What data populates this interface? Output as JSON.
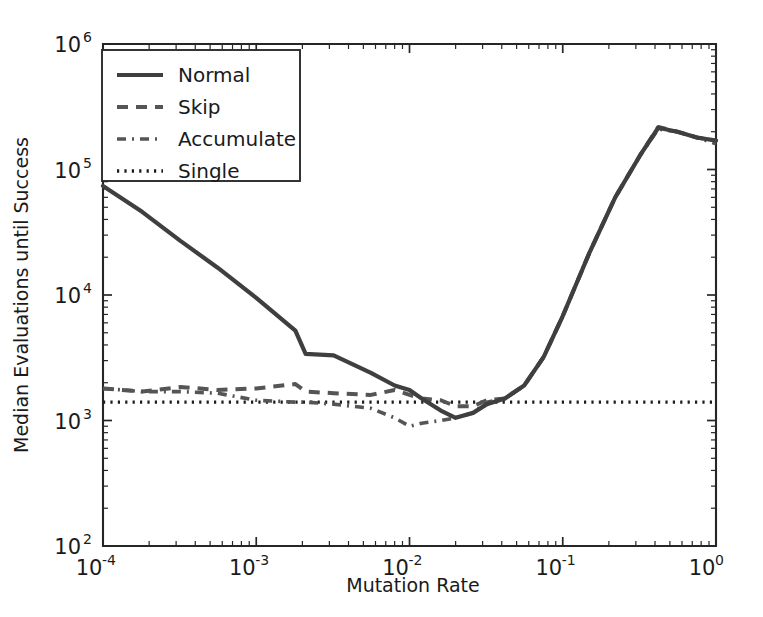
{
  "chart_data": {
    "type": "line",
    "title": "",
    "xlabel": "Mutation Rate",
    "ylabel": "Median Evaluations until Success",
    "xscale": "log",
    "yscale": "log",
    "xlim": [
      0.0001,
      1.0
    ],
    "ylim": [
      100,
      1000000
    ],
    "xticks": [
      0.0001,
      0.001,
      0.01,
      0.1,
      1.0
    ],
    "xticklabels": [
      "10^-4",
      "10^-3",
      "10^-2",
      "10^-1",
      "10^0"
    ],
    "yticks": [
      100,
      1000,
      10000,
      100000,
      1000000
    ],
    "yticklabels": [
      "10^2",
      "10^3",
      "10^4",
      "10^5",
      "10^6"
    ],
    "grid": false,
    "legend_position": "upper left",
    "series": [
      {
        "name": "Normal",
        "linestyle": "solid",
        "color": "#3f3f3f",
        "x": [
          0.0001,
          0.00018,
          0.00032,
          0.00056,
          0.001,
          0.0018,
          0.0021,
          0.0032,
          0.0056,
          0.008,
          0.01,
          0.012,
          0.016,
          0.02,
          0.026,
          0.032,
          0.042,
          0.056,
          0.075,
          0.1,
          0.15,
          0.22,
          0.32,
          0.42,
          0.56,
          0.75,
          1.0
        ],
        "y": [
          74000,
          46000,
          27000,
          16500,
          9500,
          5200,
          3400,
          3300,
          2400,
          1900,
          1750,
          1500,
          1200,
          1050,
          1150,
          1350,
          1500,
          1900,
          3200,
          6800,
          22000,
          60000,
          130000,
          215000,
          200000,
          180000,
          170000
        ]
      },
      {
        "name": "Skip",
        "linestyle": "dashed",
        "color": "#555555",
        "x": [
          0.0001,
          0.00018,
          0.00032,
          0.00056,
          0.001,
          0.0018,
          0.0021,
          0.0032,
          0.0056,
          0.008,
          0.01,
          0.012,
          0.016,
          0.02,
          0.026,
          0.032,
          0.042,
          0.056,
          0.075,
          0.1,
          0.15,
          0.22,
          0.32,
          0.42,
          0.56,
          0.75,
          1.0
        ],
        "y": [
          1800,
          1700,
          1850,
          1750,
          1800,
          1950,
          1700,
          1650,
          1600,
          1750,
          1600,
          1500,
          1450,
          1300,
          1300,
          1450,
          1500,
          1900,
          3200,
          6800,
          22000,
          60000,
          130000,
          218000,
          200000,
          180000,
          170000
        ]
      },
      {
        "name": "Accumulate",
        "linestyle": "dashdot",
        "color": "#555555",
        "x": [
          0.0001,
          0.00018,
          0.00032,
          0.00056,
          0.001,
          0.0018,
          0.0021,
          0.0032,
          0.0056,
          0.008,
          0.01,
          0.012,
          0.016,
          0.02,
          0.026,
          0.032,
          0.042,
          0.056,
          0.075,
          0.1,
          0.15,
          0.22,
          0.32,
          0.42,
          0.56,
          0.75,
          1.0
        ],
        "y": [
          1800,
          1700,
          1700,
          1650,
          1450,
          1400,
          1400,
          1350,
          1250,
          1050,
          900,
          950,
          1000,
          1050,
          1150,
          1400,
          1500,
          1900,
          3200,
          6800,
          22000,
          60000,
          130000,
          210000,
          200000,
          180000,
          160000
        ]
      },
      {
        "name": "Single",
        "linestyle": "dotted",
        "color": "#1c1c1c",
        "x": [
          0.0001,
          1.0
        ],
        "y": [
          1400,
          1400
        ]
      }
    ]
  },
  "legend": {
    "entries": [
      {
        "label": "Normal"
      },
      {
        "label": "Skip"
      },
      {
        "label": "Accumulate"
      },
      {
        "label": "Single"
      }
    ]
  },
  "axes": {
    "x_title": "Mutation Rate",
    "y_title": "Median Evaluations until Success",
    "x_tick_base": [
      "10",
      "10",
      "10",
      "10",
      "10"
    ],
    "x_tick_exp": [
      "-4",
      "-3",
      "-2",
      "-1",
      "0"
    ],
    "y_tick_base": [
      "10",
      "10",
      "10",
      "10",
      "10"
    ],
    "y_tick_exp": [
      "2",
      "3",
      "4",
      "5",
      "6"
    ]
  },
  "colors": {
    "axis": "#262626",
    "normal": "#3f3f3f",
    "skip": "#555555",
    "accumulate": "#555555",
    "single": "#1c1c1c",
    "background": "#ffffff"
  }
}
